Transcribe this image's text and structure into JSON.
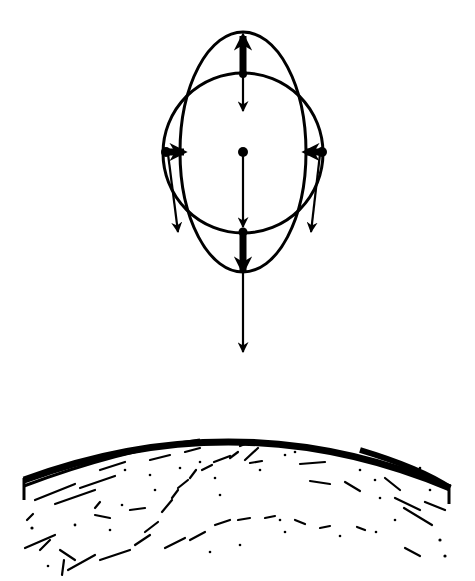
{
  "diagram": {
    "type": "tidal-forces",
    "colors": {
      "ink": "#000000",
      "background": "#ffffff"
    },
    "body": {
      "center": {
        "x": 243,
        "y": 152
      },
      "circle": {
        "r": 80
      },
      "ellipse": {
        "rx": 63,
        "ry": 120
      }
    },
    "arrows": [
      {
        "id": "top-stretch",
        "kind": "thick",
        "from": [
          243,
          74
        ],
        "to": [
          243,
          33
        ],
        "head": "up"
      },
      {
        "id": "top-pull",
        "kind": "thin",
        "from": [
          243,
          74
        ],
        "to": [
          243,
          112
        ],
        "head": "down"
      },
      {
        "id": "center-pull",
        "kind": "thin",
        "from": [
          243,
          152
        ],
        "to": [
          243,
          228
        ],
        "head": "down"
      },
      {
        "id": "bottom-stretch",
        "kind": "thick",
        "from": [
          243,
          232
        ],
        "to": [
          243,
          272
        ],
        "head": "down"
      },
      {
        "id": "bottom-pull",
        "kind": "thin",
        "from": [
          243,
          272
        ],
        "to": [
          243,
          352
        ],
        "head": "down"
      },
      {
        "id": "left-squeeze",
        "kind": "thick",
        "from": [
          165,
          152
        ],
        "to": [
          184,
          152
        ],
        "head": "right"
      },
      {
        "id": "left-pull",
        "kind": "thin",
        "from": [
          167,
          152
        ],
        "to": [
          178,
          232
        ],
        "head": "down"
      },
      {
        "id": "right-squeeze",
        "kind": "thick",
        "from": [
          322,
          152
        ],
        "to": [
          305,
          152
        ],
        "head": "left"
      },
      {
        "id": "right-pull",
        "kind": "thin",
        "from": [
          320,
          152
        ],
        "to": [
          310,
          232
        ],
        "head": "down"
      }
    ],
    "earth": {
      "label": "",
      "rim": {
        "left": [
          25,
          490
        ],
        "apex": [
          243,
          437
        ],
        "right": [
          450,
          500
        ]
      }
    }
  }
}
